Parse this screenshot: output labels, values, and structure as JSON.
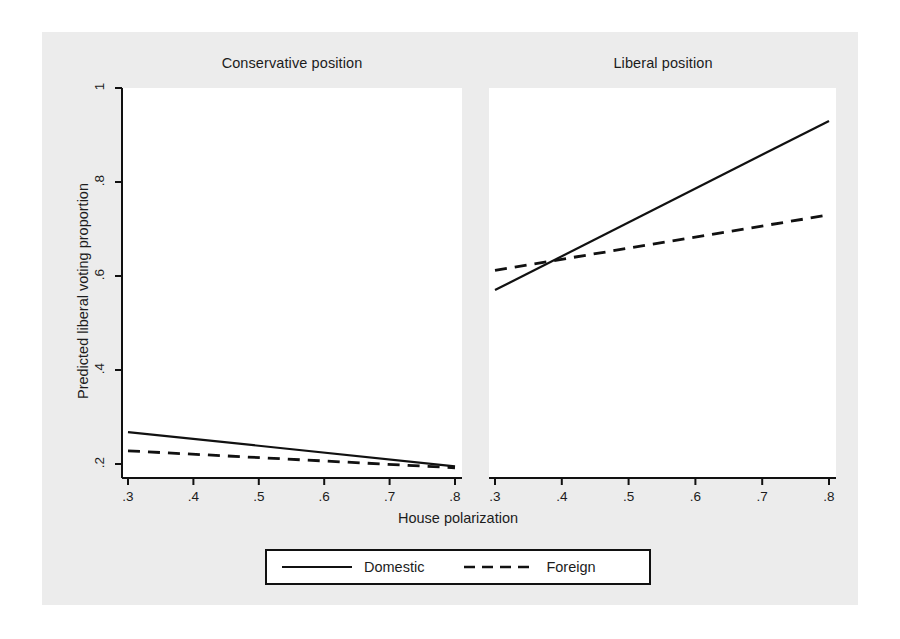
{
  "chart_data": {
    "type": "line",
    "title": "",
    "xlabel": "House polarization",
    "ylabel": "Predicted liberal voting proportion",
    "xlim": [
      0.3,
      0.8
    ],
    "ylim": [
      0.17,
      1.02
    ],
    "xticks": [
      ".3",
      ".4",
      ".5",
      ".6",
      ".7",
      ".8"
    ],
    "xtick_values": [
      0.3,
      0.4,
      0.5,
      0.6,
      0.7,
      0.8
    ],
    "yticks": [
      ".2",
      ".4",
      ".6",
      ".8",
      "1"
    ],
    "ytick_values": [
      0.2,
      0.4,
      0.6,
      0.8,
      1.0
    ],
    "grid": false,
    "legend_position": "bottom",
    "panels": [
      {
        "title": "Conservative position",
        "series": [
          {
            "name": "Domestic",
            "style": "solid",
            "x": [
              0.3,
              0.8
            ],
            "values": [
              0.268,
              0.195
            ]
          },
          {
            "name": "Foreign",
            "style": "dashed",
            "x": [
              0.3,
              0.8
            ],
            "values": [
              0.228,
              0.192
            ]
          }
        ]
      },
      {
        "title": "Liberal position",
        "series": [
          {
            "name": "Domestic",
            "style": "solid",
            "x": [
              0.3,
              0.8
            ],
            "values": [
              0.57,
              0.93
            ]
          },
          {
            "name": "Foreign",
            "style": "dashed",
            "x": [
              0.3,
              0.8
            ],
            "values": [
              0.612,
              0.73
            ]
          }
        ]
      }
    ],
    "legend": [
      {
        "label": "Domestic",
        "style": "solid"
      },
      {
        "label": "Foreign",
        "style": "dashed"
      }
    ]
  },
  "colors": {
    "figure_background": "#ececec",
    "page_background": "#ffffff",
    "plot_background": "#ffffff",
    "axis": "#111111",
    "line": "#111111",
    "text": "#1c1c1c"
  }
}
